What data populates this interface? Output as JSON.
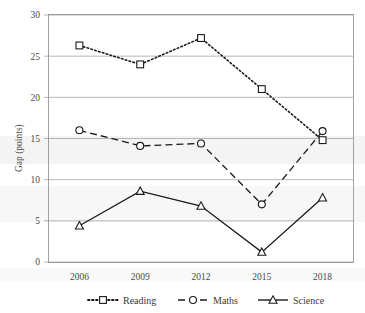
{
  "chart_data": {
    "type": "line",
    "title": "",
    "subtitle": "",
    "xlabel": "",
    "ylabel": "Gap (points)",
    "categories": [
      "2006",
      "2009",
      "2012",
      "2015",
      "2018"
    ],
    "x_tick_labels": [
      "2006",
      "2009",
      "2012",
      "2015",
      "2018"
    ],
    "y_tick_labels": [
      "0",
      "5",
      "10",
      "15",
      "20",
      "25",
      "30"
    ],
    "y_ticks": [
      0,
      5,
      10,
      15,
      20,
      25,
      30
    ],
    "ylim": [
      0,
      30
    ],
    "grid": "horizontal",
    "legend_position": "bottom",
    "series": [
      {
        "name": "Reading",
        "values": [
          26.3,
          24.0,
          27.2,
          21.0,
          14.8
        ],
        "line_style": "dotted",
        "marker": "square",
        "color": "#1a1a1a"
      },
      {
        "name": "Maths",
        "values": [
          16.0,
          14.1,
          14.4,
          7.0,
          15.9
        ],
        "line_style": "dashed",
        "marker": "circle",
        "color": "#1a1a1a"
      },
      {
        "name": "Science",
        "values": [
          4.4,
          8.6,
          6.8,
          1.2,
          7.8
        ],
        "line_style": "solid",
        "marker": "triangle",
        "color": "#1a1a1a"
      }
    ]
  },
  "legend": {
    "items": [
      {
        "label": "Reading"
      },
      {
        "label": "Maths"
      },
      {
        "label": "Science"
      }
    ]
  }
}
